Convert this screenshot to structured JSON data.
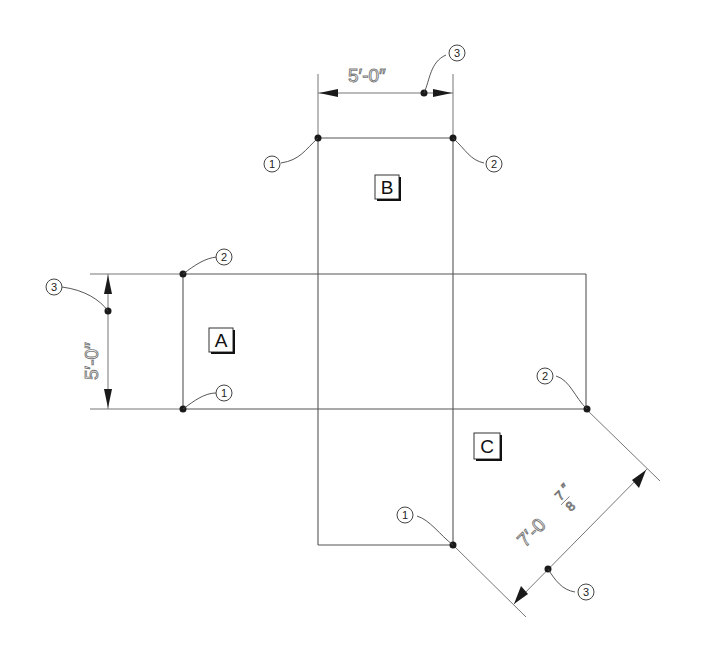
{
  "drawing": {
    "regions": [
      {
        "label": "A"
      },
      {
        "label": "B"
      },
      {
        "label": "C"
      }
    ],
    "dimensions": {
      "top": "5′-0″",
      "left": "5′-0″",
      "diagonal_main": "7′-0",
      "diagonal_frac_num": "7",
      "diagonal_frac_den": "8",
      "diagonal_inch": "″"
    },
    "callouts": {
      "b1": "1",
      "b2": "2",
      "b3": "3",
      "a1": "1",
      "a2": "2",
      "a3": "3",
      "c1": "1",
      "c2": "2",
      "c3": "3"
    }
  }
}
